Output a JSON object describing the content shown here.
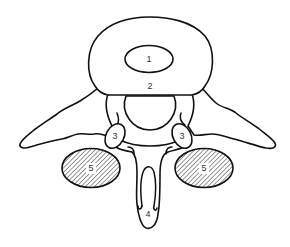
{
  "diagram": {
    "colors": {
      "stroke": "#111111",
      "background": "#ffffff",
      "label": "#333333",
      "hatch": "#333333"
    },
    "labels": {
      "nucleus": "1",
      "annulus": "2",
      "facet_left": "3",
      "facet_right": "3",
      "spinous": "4",
      "muscle_left": "5",
      "muscle_right": "5"
    },
    "shapes": {
      "vertebral_body": {
        "cx": 150,
        "top": 17,
        "bottom": 95,
        "left": 89,
        "right": 212
      },
      "inner_oval": {
        "cx": 149,
        "cy": 59,
        "rx": 24,
        "ry": 13.5
      },
      "spinal_canal": {
        "cx": 150,
        "cy": 108,
        "r": 25
      },
      "facet_left": {
        "cx": 115,
        "cy": 136,
        "rx": 9,
        "ry": 13,
        "rotate": 28
      },
      "facet_right": {
        "cx": 182,
        "cy": 136,
        "rx": 9,
        "ry": 13,
        "rotate": -28
      },
      "hatched_left": {
        "cx": 91,
        "cy": 168,
        "rx": 29,
        "ry": 19.5
      },
      "hatched_right": {
        "cx": 204,
        "cy": 168,
        "rx": 29,
        "ry": 19.5
      }
    }
  }
}
